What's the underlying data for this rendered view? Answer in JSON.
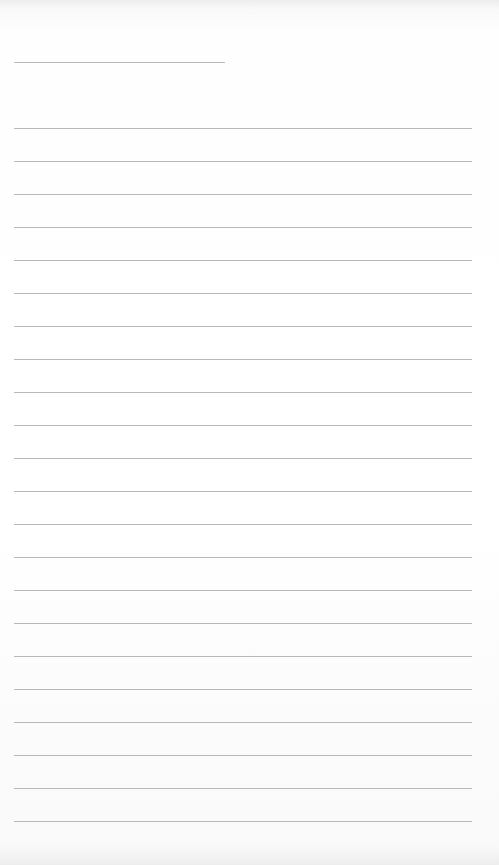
{
  "document": {
    "type": "blank lined page",
    "header_rule": {
      "y": 62,
      "x": 14,
      "width": 211
    },
    "ruled_lines": {
      "count": 22,
      "first_y": 128,
      "spacing": 33,
      "x": 14,
      "width": 458
    },
    "line_color": "#b8b8b8",
    "background_color": "#ffffff"
  }
}
